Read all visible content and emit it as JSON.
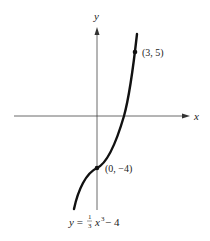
{
  "axes": {
    "x_label": "x",
    "y_label": "y"
  },
  "curve": {
    "equation_prefix": "y = ",
    "equation_frac_num": "1",
    "equation_frac_den": "3",
    "equation_var": "x",
    "equation_exp": "3",
    "equation_suffix": " − 4"
  },
  "points": [
    {
      "label": "(3, 5)"
    },
    {
      "label": "(0, −4)"
    }
  ],
  "colors": {
    "curve": "#111111",
    "axes": "#333333"
  }
}
